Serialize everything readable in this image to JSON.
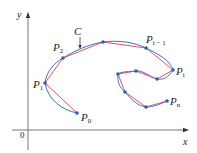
{
  "diagram": {
    "type": "polygonal-approximation-of-curve",
    "colors": {
      "axis": "#555555",
      "curve": "#3b73c8",
      "polyline": "#d9434a",
      "point": "#2f5fa8",
      "text": "#222222"
    },
    "axes": {
      "x_label": "x",
      "y_label": "y",
      "origin_label": "0"
    },
    "curve_label": "C",
    "points": [
      {
        "name": "P",
        "sub": "0",
        "x": 77,
        "y": 113
      },
      {
        "name": "P",
        "sub": "1",
        "x": 45,
        "y": 83
      },
      {
        "name": "P",
        "sub": "2",
        "x": 63,
        "y": 58
      },
      {
        "name": "",
        "sub": "",
        "x": 103,
        "y": 42
      },
      {
        "name": "P",
        "sub": "i − 1",
        "x": 146,
        "y": 48
      },
      {
        "name": "P",
        "sub": "i",
        "x": 173,
        "y": 70
      },
      {
        "name": "",
        "sub": "",
        "x": 157,
        "y": 79
      },
      {
        "name": "",
        "sub": "",
        "x": 136,
        "y": 71
      },
      {
        "name": "",
        "sub": "",
        "x": 118,
        "y": 74
      },
      {
        "name": "",
        "sub": "",
        "x": 125,
        "y": 92
      },
      {
        "name": "",
        "sub": "",
        "x": 146,
        "y": 107
      },
      {
        "name": "P",
        "sub": "n",
        "x": 167,
        "y": 101
      }
    ],
    "labels": {
      "p0": {
        "main": "P",
        "sub": "0"
      },
      "p1": {
        "main": "P",
        "sub": "1"
      },
      "p2": {
        "main": "P",
        "sub": "2"
      },
      "pim1": {
        "main": "P",
        "sub": "i − 1"
      },
      "pi": {
        "main": "P",
        "sub": "i"
      },
      "pn": {
        "main": "P",
        "sub": "n"
      }
    }
  }
}
